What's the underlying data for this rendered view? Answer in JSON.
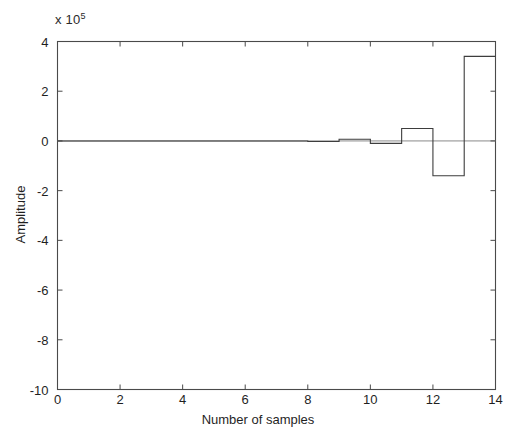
{
  "chart_data": {
    "type": "line",
    "plot_style": "stairs",
    "title": "",
    "xlabel": "Number of samples",
    "ylabel": "Amplitude",
    "y_exponent_label": "x 10",
    "y_exponent_power": "5",
    "y_scale_factor": 100000,
    "xlim": [
      0,
      14
    ],
    "ylim": [
      -10,
      4
    ],
    "xticks": [
      0,
      2,
      4,
      6,
      8,
      10,
      12,
      14
    ],
    "xtick_labels": [
      "0",
      "2",
      "4",
      "6",
      "8",
      "10",
      "12",
      "14"
    ],
    "yticks": [
      -10,
      -8,
      -6,
      -4,
      -2,
      0,
      2,
      4
    ],
    "ytick_labels": [
      "-10",
      "-8",
      "-6",
      "-4",
      "-2",
      "0",
      "2",
      "4"
    ],
    "grid": false,
    "legend": null,
    "box": true,
    "tick_direction": "in",
    "line_color": "#3d3d3d",
    "axis_color": "#4a4a4a",
    "background_color": "#ffffff",
    "x": [
      0,
      1,
      2,
      3,
      4,
      5,
      6,
      7,
      8,
      9,
      10,
      11,
      12,
      13,
      14
    ],
    "values": [
      0,
      0,
      0,
      0,
      0,
      0,
      0,
      0,
      -0.02,
      0.07,
      -0.1,
      0.5,
      -1.4,
      3.4,
      3.4
    ],
    "series": [
      {
        "name": "Amplitude",
        "units": "x 10^5",
        "values": [
          0,
          0,
          0,
          0,
          0,
          0,
          0,
          0,
          -0.02,
          0.07,
          -0.1,
          0.5,
          -1.4,
          3.4,
          3.4
        ]
      }
    ],
    "annotations": []
  }
}
